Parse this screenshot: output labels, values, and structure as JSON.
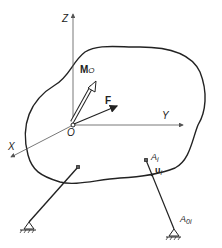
{
  "diagram": {
    "axes": {
      "z_label": "Z",
      "y_label": "Y",
      "x_label": "X",
      "origin_label": "O"
    },
    "vectors": {
      "moment_label": "M",
      "moment_subscript": "O",
      "force_label": "F"
    },
    "link_i": {
      "top_point_label": "A",
      "top_point_subscript": "i",
      "unit_vector_label": "u",
      "unit_vector_subscript": "i",
      "ground_point_label": "A",
      "ground_point_subscript": "0i"
    },
    "colors": {
      "stroke": "#222222",
      "axis": "#555555",
      "background": "#ffffff"
    }
  }
}
